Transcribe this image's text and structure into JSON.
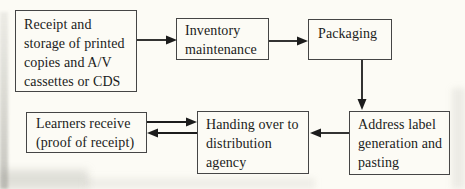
{
  "diagram": {
    "type": "flowchart",
    "background_color": "#fcfbf5",
    "box_border_color": "#454545",
    "text_color": "#1b1b1b",
    "arrow_color": "#1c1c1c",
    "boxes": {
      "receipt_storage": {
        "label": "Receipt and\nstorage of printed\ncopies and A/V\ncassettes or CDS"
      },
      "inventory_maintenance": {
        "label": "Inventory\nmaintenance"
      },
      "packaging": {
        "label": "Packaging"
      },
      "address_label": {
        "label": "Address label\ngeneration and\npasting"
      },
      "handing_over": {
        "label": "Handing over to\ndistribution\nagency"
      },
      "learners_receive": {
        "label": "Learners receive\n(proof of receipt)"
      }
    },
    "edges": [
      {
        "from": "receipt_storage",
        "to": "inventory_maintenance",
        "direction": "right"
      },
      {
        "from": "inventory_maintenance",
        "to": "packaging",
        "direction": "right"
      },
      {
        "from": "packaging",
        "to": "address_label",
        "direction": "down"
      },
      {
        "from": "address_label",
        "to": "handing_over",
        "direction": "left"
      },
      {
        "from": "learners_receive",
        "to": "handing_over",
        "direction": "right"
      },
      {
        "from": "handing_over",
        "to": "learners_receive",
        "direction": "left"
      }
    ]
  }
}
